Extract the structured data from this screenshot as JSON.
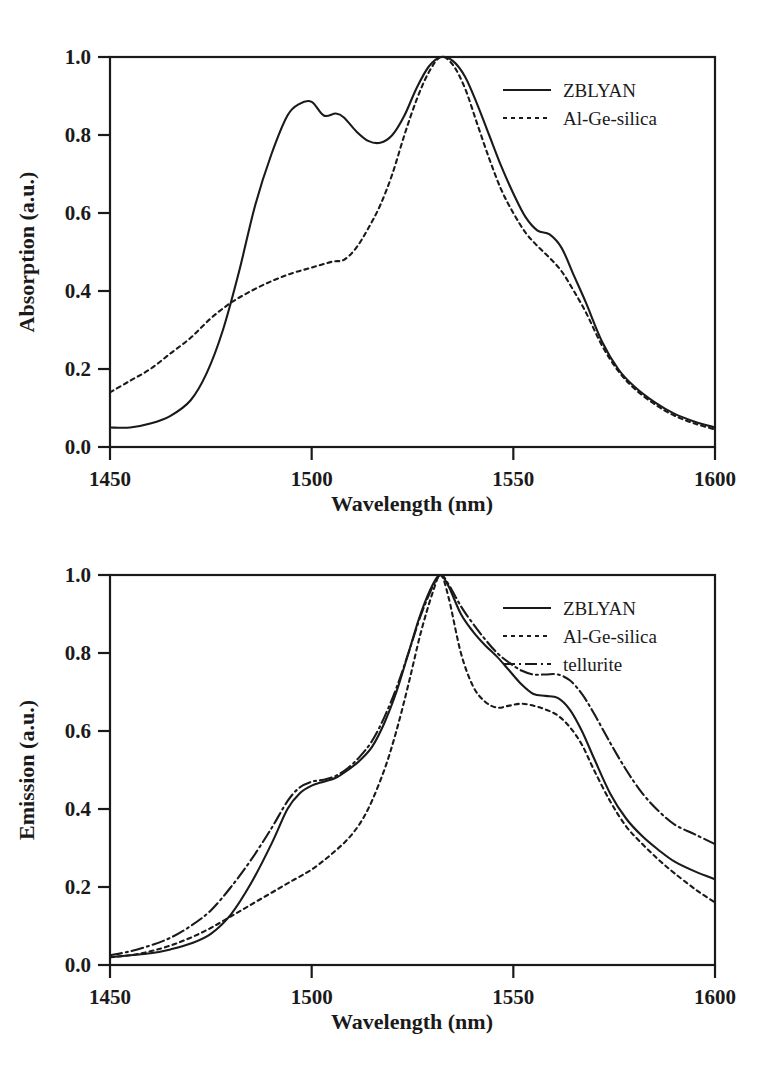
{
  "figure": {
    "panels": [
      "absorption",
      "emission"
    ]
  },
  "chart_data": [
    {
      "id": "absorption",
      "type": "line",
      "title": "",
      "xlabel": "Wavelength (nm)",
      "ylabel": "Absorption (a.u.)",
      "xlim": [
        1450,
        1600
      ],
      "ylim": [
        0.0,
        1.0
      ],
      "xticks": [
        1450,
        1500,
        1550,
        1600
      ],
      "xtick_labels": [
        "1450",
        "1500",
        "1550",
        "1600"
      ],
      "yticks": [
        0.0,
        0.2,
        0.4,
        0.6,
        0.8,
        1.0
      ],
      "ytick_labels": [
        "0.0",
        "0.2",
        "0.4",
        "0.6",
        "0.8",
        "1.0"
      ],
      "grid": false,
      "legend_position": "top-right",
      "series": [
        {
          "name": "ZBLYAN",
          "style": "solid",
          "x": [
            1450,
            1455,
            1460,
            1465,
            1470,
            1474,
            1478,
            1482,
            1486,
            1490,
            1494,
            1497,
            1500,
            1503,
            1506,
            1508,
            1511,
            1514,
            1517,
            1520,
            1523,
            1526,
            1529,
            1532,
            1535,
            1538,
            1541,
            1544,
            1547,
            1550,
            1553,
            1556,
            1559,
            1562,
            1565,
            1568,
            1572,
            1576,
            1580,
            1585,
            1590,
            1595,
            1600
          ],
          "y": [
            0.05,
            0.05,
            0.06,
            0.08,
            0.12,
            0.19,
            0.3,
            0.45,
            0.62,
            0.75,
            0.85,
            0.88,
            0.885,
            0.85,
            0.855,
            0.845,
            0.81,
            0.785,
            0.78,
            0.8,
            0.85,
            0.92,
            0.975,
            1.0,
            0.99,
            0.95,
            0.88,
            0.8,
            0.72,
            0.65,
            0.59,
            0.555,
            0.545,
            0.51,
            0.44,
            0.37,
            0.27,
            0.2,
            0.155,
            0.115,
            0.085,
            0.065,
            0.05
          ]
        },
        {
          "name": "Al-Ge-silica",
          "style": "dotted",
          "x": [
            1450,
            1455,
            1460,
            1465,
            1470,
            1475,
            1480,
            1485,
            1490,
            1495,
            1500,
            1505,
            1508,
            1511,
            1514,
            1517,
            1520,
            1523,
            1526,
            1529,
            1532,
            1535,
            1538,
            1541,
            1544,
            1547,
            1550,
            1553,
            1556,
            1559,
            1562,
            1565,
            1568,
            1572,
            1576,
            1580,
            1585,
            1590,
            1595,
            1600
          ],
          "y": [
            0.14,
            0.17,
            0.2,
            0.24,
            0.28,
            0.33,
            0.37,
            0.4,
            0.425,
            0.445,
            0.46,
            0.475,
            0.48,
            0.51,
            0.56,
            0.62,
            0.7,
            0.8,
            0.89,
            0.96,
            1.0,
            0.98,
            0.92,
            0.83,
            0.74,
            0.66,
            0.6,
            0.55,
            0.515,
            0.485,
            0.45,
            0.4,
            0.345,
            0.26,
            0.195,
            0.15,
            0.11,
            0.08,
            0.06,
            0.045
          ]
        }
      ]
    },
    {
      "id": "emission",
      "type": "line",
      "title": "",
      "xlabel": "Wavelength (nm)",
      "ylabel": "Emission (a.u.)",
      "xlim": [
        1450,
        1600
      ],
      "ylim": [
        0.0,
        1.0
      ],
      "xticks": [
        1450,
        1500,
        1550,
        1600
      ],
      "xtick_labels": [
        "1450",
        "1500",
        "1550",
        "1600"
      ],
      "yticks": [
        0.0,
        0.2,
        0.4,
        0.6,
        0.8,
        1.0
      ],
      "ytick_labels": [
        "0.0",
        "0.2",
        "0.4",
        "0.6",
        "0.8",
        "1.0"
      ],
      "grid": false,
      "legend_position": "top-right",
      "series": [
        {
          "name": "ZBLYAN",
          "style": "solid",
          "x": [
            1450,
            1455,
            1460,
            1465,
            1470,
            1475,
            1480,
            1485,
            1490,
            1494,
            1497,
            1500,
            1503,
            1506,
            1509,
            1512,
            1515,
            1518,
            1521,
            1524,
            1527,
            1530,
            1532,
            1534,
            1537,
            1540,
            1543,
            1546,
            1549,
            1552,
            1555,
            1558,
            1561,
            1564,
            1567,
            1570,
            1574,
            1578,
            1582,
            1586,
            1590,
            1595,
            1600
          ],
          "y": [
            0.02,
            0.025,
            0.03,
            0.04,
            0.055,
            0.08,
            0.13,
            0.21,
            0.31,
            0.4,
            0.44,
            0.46,
            0.47,
            0.48,
            0.5,
            0.525,
            0.56,
            0.62,
            0.7,
            0.8,
            0.9,
            0.975,
            1.0,
            0.97,
            0.9,
            0.855,
            0.82,
            0.79,
            0.755,
            0.72,
            0.695,
            0.69,
            0.685,
            0.655,
            0.6,
            0.53,
            0.44,
            0.375,
            0.33,
            0.295,
            0.265,
            0.24,
            0.22
          ]
        },
        {
          "name": "Al-Ge-silica",
          "style": "dotted",
          "x": [
            1450,
            1455,
            1460,
            1465,
            1470,
            1475,
            1480,
            1485,
            1490,
            1495,
            1500,
            1505,
            1510,
            1514,
            1518,
            1521,
            1524,
            1527,
            1530,
            1532,
            1534,
            1537,
            1540,
            1543,
            1546,
            1549,
            1552,
            1555,
            1558,
            1561,
            1564,
            1567,
            1570,
            1574,
            1578,
            1582,
            1586,
            1590,
            1595,
            1600
          ],
          "y": [
            0.02,
            0.025,
            0.035,
            0.05,
            0.07,
            0.095,
            0.125,
            0.155,
            0.185,
            0.215,
            0.245,
            0.285,
            0.335,
            0.4,
            0.5,
            0.6,
            0.72,
            0.85,
            0.955,
            1.0,
            0.94,
            0.8,
            0.715,
            0.675,
            0.66,
            0.665,
            0.67,
            0.665,
            0.655,
            0.64,
            0.61,
            0.565,
            0.5,
            0.42,
            0.355,
            0.31,
            0.27,
            0.235,
            0.195,
            0.16
          ]
        },
        {
          "name": "tellurite",
          "style": "dash-dot",
          "x": [
            1450,
            1455,
            1460,
            1465,
            1470,
            1475,
            1480,
            1485,
            1490,
            1494,
            1497,
            1500,
            1503,
            1506,
            1509,
            1512,
            1515,
            1518,
            1521,
            1524,
            1527,
            1530,
            1532,
            1534,
            1537,
            1540,
            1543,
            1546,
            1549,
            1552,
            1555,
            1558,
            1561,
            1564,
            1567,
            1570,
            1574,
            1578,
            1582,
            1586,
            1590,
            1595,
            1600
          ],
          "y": [
            0.025,
            0.035,
            0.05,
            0.07,
            0.1,
            0.14,
            0.2,
            0.27,
            0.35,
            0.42,
            0.455,
            0.47,
            0.475,
            0.485,
            0.505,
            0.535,
            0.575,
            0.635,
            0.71,
            0.8,
            0.895,
            0.97,
            1.0,
            0.975,
            0.92,
            0.875,
            0.835,
            0.8,
            0.775,
            0.755,
            0.745,
            0.745,
            0.745,
            0.73,
            0.695,
            0.645,
            0.57,
            0.5,
            0.44,
            0.395,
            0.36,
            0.335,
            0.31
          ]
        }
      ]
    }
  ]
}
